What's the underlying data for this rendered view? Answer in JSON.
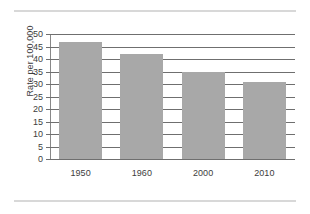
{
  "chart_data": {
    "type": "bar",
    "title": "",
    "xlabel": "",
    "ylabel": "Rate per 100,000",
    "categories": [
      "1950",
      "1960",
      "2000",
      "2010"
    ],
    "values": [
      47,
      42,
      35,
      31
    ],
    "ylim": [
      0,
      50
    ],
    "ytick_step": 5,
    "yticks": [
      "50",
      "45",
      "40",
      "35",
      "30",
      "25",
      "20",
      "15",
      "10",
      "5",
      "0"
    ],
    "grid": true,
    "legend": "none",
    "bar_color": "#a8a8a8",
    "gridline_color": "#6f6f6f",
    "axis_color": "#888888",
    "text_color": "#3d3d3d",
    "background_color": "#ffffff"
  },
  "decoration": {
    "rule_color": "#d8d8d8",
    "top_rule": "horizontal-rule",
    "bottom_rule": "horizontal-rule"
  }
}
